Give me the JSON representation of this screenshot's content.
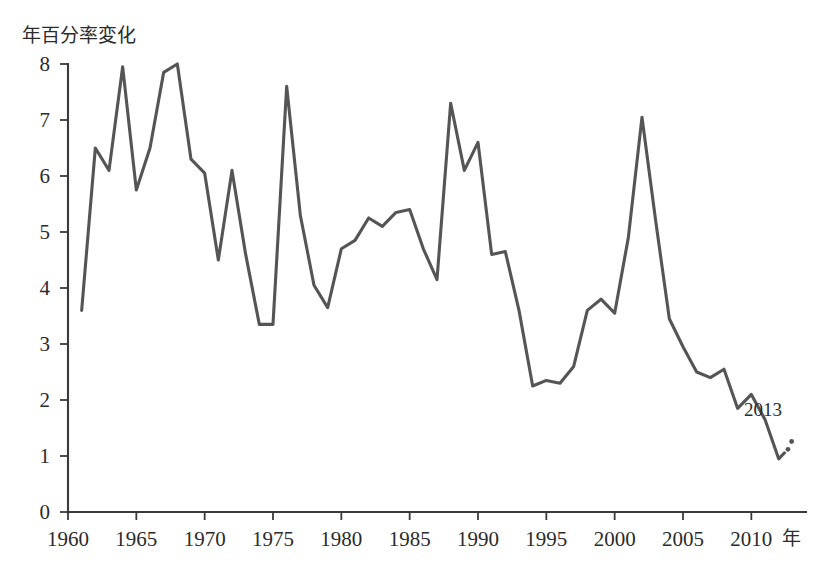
{
  "chart_data": {
    "type": "line",
    "title": "",
    "ylabel": "年百分率変化",
    "xlabel": "年",
    "xlim": [
      1960,
      2014
    ],
    "ylim": [
      0,
      8
    ],
    "y_ticks": [
      "0",
      "1",
      "2",
      "3",
      "4",
      "5",
      "6",
      "7",
      "8"
    ],
    "y_tick_values": [
      0,
      1,
      2,
      3,
      4,
      5,
      6,
      7,
      8
    ],
    "x_ticks": [
      "1960",
      "1965",
      "1970",
      "1975",
      "1980",
      "1985",
      "1990",
      "1995",
      "2000",
      "2005",
      "2010"
    ],
    "x_tick_values": [
      1960,
      1965,
      1970,
      1975,
      1980,
      1985,
      1990,
      1995,
      2000,
      2005,
      2010
    ],
    "grid": false,
    "legend": "none",
    "line_color": "#555555",
    "axis_color": "#3a3a3a",
    "background_color": "#ffffff",
    "annotations": [
      {
        "label": "2013",
        "x": 2013,
        "y": 1.2,
        "note": "end-of-series year label with dotted lead-in"
      }
    ],
    "x": [
      1961,
      1962,
      1963,
      1964,
      1965,
      1966,
      1967,
      1968,
      1969,
      1970,
      1971,
      1972,
      1973,
      1974,
      1975,
      1976,
      1977,
      1978,
      1979,
      1980,
      1981,
      1982,
      1983,
      1984,
      1985,
      1986,
      1987,
      1988,
      1989,
      1990,
      1991,
      1992,
      1993,
      1994,
      1995,
      1996,
      1997,
      1998,
      1999,
      2000,
      2001,
      2002,
      2003,
      2004,
      2005,
      2006,
      2007,
      2008,
      2009,
      2010,
      2011,
      2012,
      2013
    ],
    "values": [
      3.6,
      6.5,
      6.1,
      7.95,
      5.75,
      6.5,
      7.85,
      8.0,
      6.3,
      6.05,
      4.5,
      6.1,
      4.6,
      3.35,
      3.35,
      7.6,
      5.3,
      4.05,
      3.65,
      4.7,
      4.85,
      5.25,
      5.1,
      5.35,
      5.4,
      4.7,
      4.15,
      7.3,
      6.1,
      6.6,
      4.6,
      4.65,
      3.6,
      2.25,
      2.35,
      2.3,
      2.6,
      3.6,
      3.8,
      3.55,
      4.9,
      7.05,
      5.2,
      3.45,
      2.95,
      2.5,
      2.4,
      2.55,
      1.85,
      2.1,
      1.65,
      0.95,
      1.2
    ],
    "series": [
      {
        "name": "年百分率変化",
        "values": [
          3.6,
          6.5,
          6.1,
          7.95,
          5.75,
          6.5,
          7.85,
          8.0,
          6.3,
          6.05,
          4.5,
          6.1,
          4.6,
          3.35,
          3.35,
          7.6,
          5.3,
          4.05,
          3.65,
          4.7,
          4.85,
          5.25,
          5.1,
          5.35,
          5.4,
          4.7,
          4.15,
          7.3,
          6.1,
          6.6,
          4.6,
          4.65,
          3.6,
          2.25,
          2.35,
          2.3,
          2.6,
          3.6,
          3.8,
          3.55,
          4.9,
          7.05,
          5.2,
          3.45,
          2.95,
          2.5,
          2.4,
          2.55,
          1.85,
          2.1,
          1.65,
          0.95,
          1.2
        ]
      }
    ]
  }
}
